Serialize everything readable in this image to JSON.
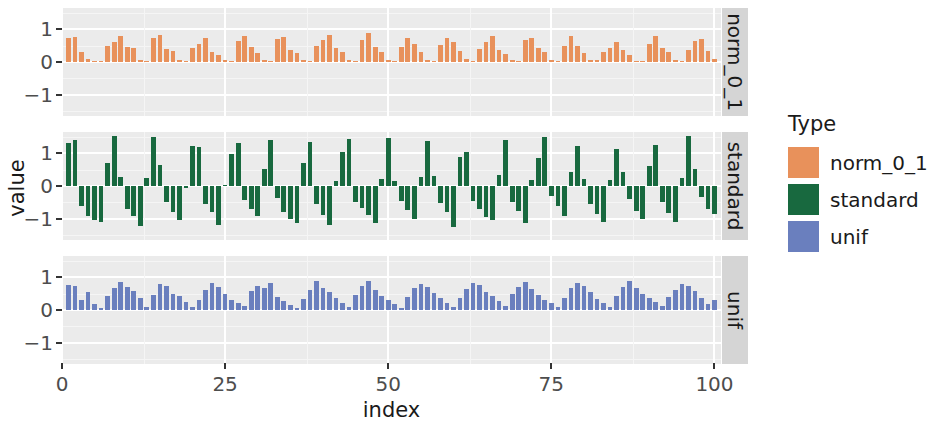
{
  "chart_data": {
    "type": "bar",
    "title": "",
    "subtitle": "",
    "xlabel": "index",
    "ylabel": "value",
    "xlim": [
      0,
      101
    ],
    "ylim": [
      -1.65,
      1.65
    ],
    "grid": true,
    "legend_position": "right",
    "legend_title": "Type",
    "facet_labels": [
      "norm_0_1",
      "standard",
      "unif"
    ],
    "x_ticks": [
      0,
      25,
      50,
      75,
      100
    ],
    "x_tick_labels": [
      "0",
      "25",
      "50",
      "75",
      "100"
    ],
    "y_ticks": [
      -1,
      0,
      1
    ],
    "y_tick_labels": [
      "-1",
      "0",
      "1"
    ],
    "colors": {
      "norm_0_1": "#E8915B",
      "standard": "#18693F",
      "unif": "#6A7FBE",
      "panel_background": "#ebebeb",
      "grid_major": "#ffffff",
      "grid_minor": "#f5f5f5",
      "strip_background": "#d5d5d5",
      "text": "#1a1a1a",
      "axis_text": "#4d4d4d"
    },
    "x": [
      1,
      2,
      3,
      4,
      5,
      6,
      7,
      8,
      9,
      10,
      11,
      12,
      13,
      14,
      15,
      16,
      17,
      18,
      19,
      20,
      21,
      22,
      23,
      24,
      25,
      26,
      27,
      28,
      29,
      30,
      31,
      32,
      33,
      34,
      35,
      36,
      37,
      38,
      39,
      40,
      41,
      42,
      43,
      44,
      45,
      46,
      47,
      48,
      49,
      50,
      51,
      52,
      53,
      54,
      55,
      56,
      57,
      58,
      59,
      60,
      61,
      62,
      63,
      64,
      65,
      66,
      67,
      68,
      69,
      70,
      71,
      72,
      73,
      74,
      75,
      76,
      77,
      78,
      79,
      80,
      81,
      82,
      83,
      84,
      85,
      86,
      87,
      88,
      89,
      90,
      91,
      92,
      93,
      94,
      95,
      96,
      97,
      98,
      99,
      100
    ],
    "series": [
      {
        "name": "norm_0_1",
        "facet": "norm_0_1",
        "color": "#E8915B",
        "values": [
          0.72,
          0.76,
          0.3,
          0.08,
          0.03,
          0.02,
          0.5,
          0.62,
          0.78,
          0.46,
          0.42,
          0.05,
          0.04,
          0.72,
          0.84,
          0.4,
          0.34,
          0.06,
          0.03,
          0.44,
          0.56,
          0.74,
          0.3,
          0.22,
          0.05,
          0.04,
          0.63,
          0.8,
          0.46,
          0.28,
          0.07,
          0.04,
          0.7,
          0.77,
          0.38,
          0.28,
          0.05,
          0.03,
          0.48,
          0.66,
          0.83,
          0.42,
          0.3,
          0.06,
          0.04,
          0.68,
          0.88,
          0.45,
          0.32,
          0.07,
          0.03,
          0.46,
          0.72,
          0.56,
          0.3,
          0.06,
          0.04,
          0.52,
          0.74,
          0.6,
          0.34,
          0.08,
          0.03,
          0.4,
          0.62,
          0.8,
          0.36,
          0.24,
          0.05,
          0.04,
          0.66,
          0.72,
          0.42,
          0.32,
          0.06,
          0.03,
          0.5,
          0.8,
          0.48,
          0.28,
          0.07,
          0.05,
          0.3,
          0.44,
          0.62,
          0.36,
          0.22,
          0.04,
          0.03,
          0.56,
          0.78,
          0.43,
          0.3,
          0.06,
          0.03,
          0.38,
          0.64,
          0.7,
          0.34,
          0.08
        ]
      },
      {
        "name": "standard",
        "facet": "standard",
        "color": "#18693F",
        "values": [
          1.32,
          1.42,
          -0.62,
          -0.93,
          -1.05,
          -1.1,
          0.7,
          1.52,
          0.28,
          -0.7,
          -0.92,
          -1.22,
          0.25,
          1.5,
          0.63,
          -0.5,
          -0.78,
          -1.05,
          -0.05,
          1.22,
          1.18,
          -0.55,
          -0.8,
          -1.18,
          0.02,
          0.98,
          1.3,
          -0.42,
          -0.7,
          -0.92,
          0.52,
          1.42,
          -0.36,
          -0.78,
          -1.0,
          -1.14,
          0.7,
          1.35,
          -0.55,
          -0.9,
          -1.18,
          0.14,
          1.05,
          1.45,
          -0.48,
          -0.68,
          -0.88,
          -1.12,
          0.22,
          1.48,
          0.14,
          -0.45,
          -0.72,
          -1.02,
          0.28,
          1.38,
          0.3,
          -0.52,
          -0.8,
          -1.25,
          0.88,
          1.04,
          -0.45,
          -0.7,
          -0.95,
          -1.05,
          0.35,
          1.4,
          -0.48,
          -0.75,
          -1.12,
          0.18,
          0.86,
          1.5,
          -0.3,
          -0.62,
          -0.92,
          0.44,
          1.22,
          0.2,
          -0.55,
          -0.85,
          -1.1,
          0.18,
          1.12,
          0.42,
          -0.4,
          -0.75,
          -1.02,
          0.62,
          1.25,
          -0.5,
          -0.82,
          -1.1,
          0.25,
          1.52,
          0.52,
          -0.35,
          -0.7,
          -0.85
        ]
      },
      {
        "name": "unif",
        "facet": "unif",
        "color": "#6A7FBE",
        "values": [
          0.76,
          0.72,
          0.3,
          0.55,
          0.18,
          0.05,
          0.42,
          0.68,
          0.86,
          0.7,
          0.58,
          0.38,
          0.1,
          0.45,
          0.8,
          0.74,
          0.5,
          0.44,
          0.25,
          0.08,
          0.32,
          0.6,
          0.82,
          0.7,
          0.48,
          0.3,
          0.2,
          0.12,
          0.58,
          0.74,
          0.66,
          0.84,
          0.4,
          0.28,
          0.16,
          0.06,
          0.35,
          0.62,
          0.9,
          0.68,
          0.55,
          0.38,
          0.22,
          0.1,
          0.45,
          0.72,
          0.88,
          0.62,
          0.44,
          0.3,
          0.18,
          0.07,
          0.4,
          0.66,
          0.8,
          0.7,
          0.52,
          0.36,
          0.2,
          0.09,
          0.38,
          0.64,
          0.82,
          0.76,
          0.56,
          0.42,
          0.26,
          0.12,
          0.48,
          0.7,
          0.86,
          0.64,
          0.46,
          0.32,
          0.2,
          0.08,
          0.36,
          0.68,
          0.84,
          0.72,
          0.54,
          0.34,
          0.22,
          0.1,
          0.44,
          0.7,
          0.88,
          0.66,
          0.5,
          0.38,
          0.24,
          0.11,
          0.4,
          0.62,
          0.8,
          0.74,
          0.58,
          0.36,
          0.18,
          0.3
        ]
      }
    ]
  },
  "legend": {
    "title": "Type",
    "items": [
      {
        "label": "norm_0_1",
        "color": "#E8915B"
      },
      {
        "label": "standard",
        "color": "#18693F"
      },
      {
        "label": "unif",
        "color": "#6A7FBE"
      }
    ]
  },
  "axes": {
    "x_title": "index",
    "y_title": "value"
  }
}
